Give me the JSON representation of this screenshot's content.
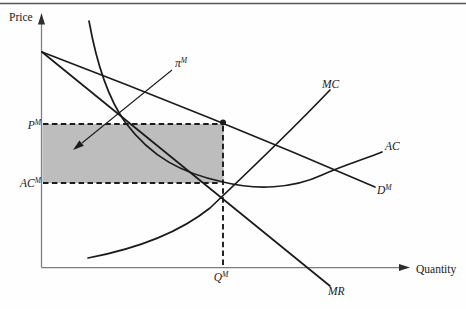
{
  "figure": {
    "type": "monopoly-profit-diagram",
    "axes": {
      "y_label": "Price",
      "x_label": "Quantity"
    },
    "axis_marks": {
      "monopoly_price": {
        "base": "P",
        "sup": "M"
      },
      "monopoly_average_cost": {
        "base": "AC",
        "sup": "M"
      },
      "monopoly_quantity": {
        "base": "Q",
        "sup": "M"
      }
    },
    "curve_labels": {
      "marginal_cost": "MC",
      "average_cost": "AC",
      "marginal_revenue": "MR",
      "demand": {
        "base": "D",
        "sup": "M"
      },
      "profit": {
        "base": "π",
        "sup": "M"
      }
    },
    "curves": {
      "demand_path": "M 42 52 Q 215 118 375 187",
      "marginal_revenue_path": "M 42 52 L 330 286",
      "marginal_cost_path": "M 88 258 C 130 250 175 236 210 208 C 248 172 288 134 330 90",
      "average_cost_path": "M 89 21 C 96 60 108 98 125 122 C 152 158 182 173 223 182 C 255 190 292 189 322 175 C 344 165 362 160 382 152",
      "profit_arrow_path": "M 172 70 L 82 143",
      "dashed_price_line": "M 43 124 L 220 124",
      "dashed_average_cost_line": "M 43 183 L 221 183",
      "dashed_quantity_line": "M 223 126 L 223 266.5"
    },
    "colors": {
      "curve": "#1b1b1b",
      "axis": "#7d7d7d",
      "shade": "#bdbdbd",
      "rule": "#565656",
      "text": "#1a1a1a"
    }
  }
}
